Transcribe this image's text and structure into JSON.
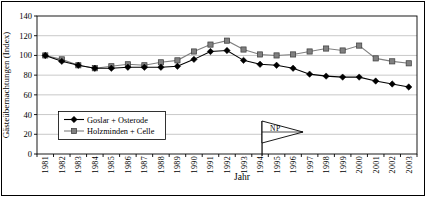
{
  "chart_data": {
    "type": "line",
    "title": "",
    "xlabel": "Jahr",
    "ylabel": "Gästeübernachtungen (Index)",
    "ylim": [
      0,
      140
    ],
    "ytick_step": 20,
    "grid": true,
    "legend_position": "inside-bottom-left",
    "categories": [
      "1981",
      "1982",
      "1983",
      "1984",
      "1985",
      "1986",
      "1987",
      "1988",
      "1989",
      "1990",
      "1991",
      "1992",
      "1993",
      "1994",
      "1995",
      "1996",
      "1997",
      "1998",
      "1999",
      "2000",
      "2001",
      "2002",
      "2003"
    ],
    "series": [
      {
        "name": "Goslar + Osterode",
        "marker": "diamond",
        "color": "#000000",
        "marker_stroke": "#000000",
        "values": [
          100,
          94,
          90,
          87,
          87,
          88,
          88,
          88,
          89,
          96,
          104,
          105,
          95,
          91,
          90,
          87,
          81,
          79,
          78,
          78,
          74,
          71,
          68
        ]
      },
      {
        "name": "Holzminden + Celle",
        "marker": "square",
        "color": "#808080",
        "marker_stroke": "#3a3a3a",
        "values": [
          100,
          96,
          90,
          87,
          89,
          91,
          90,
          93,
          95,
          104,
          111,
          115,
          106,
          101,
          100,
          101,
          104,
          107,
          105,
          110,
          97,
          94,
          92
        ]
      }
    ],
    "annotation": {
      "label": "NP",
      "x_category": "1994",
      "shape": "pennant-flag"
    }
  },
  "colors": {
    "background": "#ffffff",
    "axis": "#000000",
    "gridline": "#b0b0b0",
    "frame_border": "#000000",
    "flag_fill": "#ffffff"
  }
}
